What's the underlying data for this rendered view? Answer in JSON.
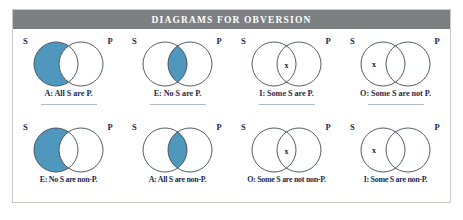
{
  "header": {
    "title": "DIAGRAMS FOR OBVERSION"
  },
  "colors": {
    "header_bar": "#7c8083",
    "shade_blue": "#4f97bd",
    "circle_stroke": "#3f4a56",
    "label_navy": "#1c2a4a",
    "divider": "#a8bccd",
    "frame_border": "#c9c9c4",
    "page_background": "#ffffff"
  },
  "venn": {
    "subject_label": "S",
    "predicate_label": "P",
    "x_glyph": "x"
  },
  "rows": [
    {
      "name": "original-propositions",
      "cells": [
        {
          "id": "A-all-s-are-p",
          "label": "A: All S are P.",
          "shade": "left-crescent",
          "x_position": "none",
          "s_label": "S",
          "p_label": "P",
          "has_divider": true
        },
        {
          "id": "E-no-s-are-p",
          "label": "E: No S are P.",
          "shade": "lens",
          "x_position": "none",
          "s_label": "S",
          "p_label": "P",
          "has_divider": true
        },
        {
          "id": "I-some-s-are-p",
          "label": "I: Some S are P.",
          "shade": "none",
          "x_position": "lens",
          "s_label": "S",
          "p_label": "P",
          "has_divider": true
        },
        {
          "id": "O-some-s-are-not-p",
          "label": "O: Some S are not P.",
          "shade": "none",
          "x_position": "left-crescent",
          "s_label": "S",
          "p_label": "P",
          "has_divider": true
        }
      ]
    },
    {
      "name": "obverted-propositions",
      "cells": [
        {
          "id": "E-no-s-are-non-p",
          "label": "E: No S are non-P.",
          "shade": "left-crescent",
          "x_position": "none",
          "s_label": "S",
          "p_label": "P",
          "has_divider": false
        },
        {
          "id": "A-all-s-are-non-p",
          "label": "A: All S are non-P.",
          "shade": "lens",
          "x_position": "none",
          "s_label": "S",
          "p_label": "P",
          "has_divider": false
        },
        {
          "id": "O-some-s-are-not-non-p",
          "label": "O: Some S are not non-P.",
          "shade": "none",
          "x_position": "lens",
          "s_label": "S",
          "p_label": "P",
          "has_divider": false
        },
        {
          "id": "I-some-s-are-non-p",
          "label": "I: Some S are non-P.",
          "shade": "none",
          "x_position": "left-crescent",
          "s_label": "S",
          "p_label": "P",
          "has_divider": false
        }
      ]
    }
  ]
}
